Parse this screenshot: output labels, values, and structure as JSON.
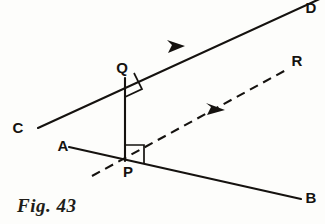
{
  "figure": {
    "caption": "Fig. 43",
    "background_color": "#fdfdfb",
    "ink_color": "#15120f"
  },
  "labels": {
    "A": "A",
    "B": "B",
    "C": "C",
    "D": "D",
    "P": "P",
    "Q": "Q",
    "R": "R"
  },
  "geometry": {
    "points": {
      "C": {
        "x": 38,
        "y": 128
      },
      "D": {
        "x": 322,
        "y": -2
      },
      "A": {
        "x": 70,
        "y": 147
      },
      "B": {
        "x": 300,
        "y": 198
      },
      "P": {
        "x": 125,
        "y": 160
      },
      "Q": {
        "x": 125,
        "y": 78
      },
      "R": {
        "x": 287,
        "y": 69
      },
      "dash_tail": {
        "x": 92,
        "y": 175
      }
    },
    "segments": [
      {
        "name": "line-CD",
        "from": "C",
        "to": "D",
        "style": "solid",
        "arrow": "mid-forward"
      },
      {
        "name": "line-AB",
        "from": "A",
        "to": "B",
        "style": "solid",
        "arrow": "none"
      },
      {
        "name": "segment-PQ",
        "from": "P",
        "to": "Q",
        "style": "solid",
        "arrow": "none"
      },
      {
        "name": "ray-PR",
        "from": "dash_tail",
        "to": "R",
        "style": "dashed",
        "arrow": "mid-forward"
      }
    ],
    "right_angles": [
      {
        "name": "right-angle-at-Q",
        "vertex": "Q",
        "between": [
          "segment-QP",
          "ray-QD"
        ]
      },
      {
        "name": "right-angle-at-P",
        "vertex": "P",
        "between": [
          "segment-PQ",
          "ray-PR"
        ]
      }
    ]
  }
}
